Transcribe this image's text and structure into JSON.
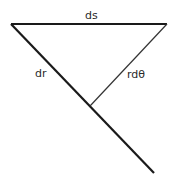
{
  "diagram": {
    "labels": {
      "top_side": "ds",
      "diagonal_side": "dr",
      "perpendicular_side": "rdθ"
    },
    "colors": {
      "line": "#1a1a1a",
      "background": "#ffffff"
    }
  }
}
